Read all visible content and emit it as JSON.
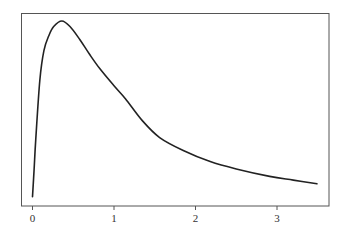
{
  "chart_data": {
    "type": "line",
    "title": "",
    "xlabel": "",
    "ylabel": "",
    "xlim": [
      -0.14,
      3.6
    ],
    "ylim": [
      0,
      1.04
    ],
    "grid": false,
    "legend": null,
    "xticks": [
      0,
      1,
      2,
      3
    ],
    "xtick_labels": [
      "0",
      "1",
      "2",
      "3"
    ],
    "yticks": [],
    "series": [
      {
        "name": "density",
        "color": "#222222",
        "x": [
          0.0,
          0.02,
          0.04,
          0.09,
          0.14,
          0.2,
          0.26,
          0.36,
          0.46,
          0.58,
          0.7,
          0.83,
          1.0,
          1.14,
          1.35,
          1.56,
          1.85,
          2.18,
          2.5,
          2.91,
          3.2,
          3.49
        ],
        "y": [
          0.05,
          0.2,
          0.36,
          0.68,
          0.84,
          0.92,
          0.97,
          1.0,
          0.97,
          0.9,
          0.82,
          0.74,
          0.65,
          0.58,
          0.46,
          0.37,
          0.3,
          0.24,
          0.2,
          0.16,
          0.14,
          0.12
        ]
      }
    ]
  }
}
